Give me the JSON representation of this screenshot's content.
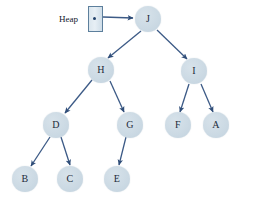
{
  "diagram": {
    "colors": {
      "node_fill": "#ccdae4",
      "node_fill_light": "#d7e2ea",
      "edge": "#3c5a86",
      "box_border": "#5d7f9c",
      "box_fill": "#dbe6ee",
      "text": "#1d2b3a",
      "background": "#ffffff"
    },
    "pointer": {
      "label": "Heap",
      "label_x": 59,
      "label_y": 14,
      "box_x": 88,
      "box_y": 6,
      "box_w": 15,
      "box_h": 26,
      "dot_x": 93,
      "dot_y": 17
    },
    "nodes": [
      {
        "id": "J",
        "label": "J",
        "cx": 148,
        "cy": 19,
        "r": 13
      },
      {
        "id": "H",
        "label": "H",
        "cx": 101,
        "cy": 70,
        "r": 13
      },
      {
        "id": "I",
        "label": "I",
        "cx": 194,
        "cy": 71,
        "r": 13
      },
      {
        "id": "D",
        "label": "D",
        "cx": 56,
        "cy": 125,
        "r": 13
      },
      {
        "id": "G",
        "label": "G",
        "cx": 130,
        "cy": 125,
        "r": 13
      },
      {
        "id": "F",
        "label": "F",
        "cx": 178,
        "cy": 125,
        "r": 13
      },
      {
        "id": "A",
        "label": "A",
        "cx": 216,
        "cy": 125,
        "r": 13
      },
      {
        "id": "B",
        "label": "B",
        "cx": 25,
        "cy": 179,
        "r": 13
      },
      {
        "id": "C",
        "label": "C",
        "cx": 70,
        "cy": 179,
        "r": 13
      },
      {
        "id": "E",
        "label": "E",
        "cx": 117,
        "cy": 179,
        "r": 13
      }
    ],
    "edges": [
      {
        "from": "Heap",
        "to": "J",
        "x1": 103,
        "y1": 17,
        "x2": 133,
        "y2": 18
      },
      {
        "from": "J",
        "to": "H",
        "x1": 141,
        "y1": 31,
        "x2": 108,
        "y2": 58
      },
      {
        "from": "J",
        "to": "I",
        "x1": 157,
        "y1": 30,
        "x2": 187,
        "y2": 59
      },
      {
        "from": "H",
        "to": "D",
        "x1": 92,
        "y1": 80,
        "x2": 65,
        "y2": 113
      },
      {
        "from": "H",
        "to": "G",
        "x1": 110,
        "y1": 81,
        "x2": 124,
        "y2": 112
      },
      {
        "from": "I",
        "to": "F",
        "x1": 189,
        "y1": 84,
        "x2": 180,
        "y2": 112
      },
      {
        "from": "I",
        "to": "A",
        "x1": 201,
        "y1": 84,
        "x2": 213,
        "y2": 112
      },
      {
        "from": "D",
        "to": "B",
        "x1": 50,
        "y1": 137,
        "x2": 31,
        "y2": 166
      },
      {
        "from": "D",
        "to": "C",
        "x1": 61,
        "y1": 137,
        "x2": 70,
        "y2": 165
      },
      {
        "from": "G",
        "to": "E",
        "x1": 126,
        "y1": 137,
        "x2": 119,
        "y2": 165
      }
    ]
  }
}
